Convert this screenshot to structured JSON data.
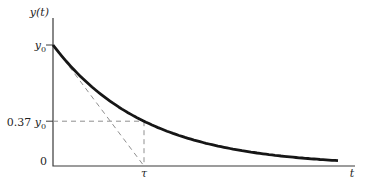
{
  "figure_labels": {
    "y_axis": "y(t)",
    "y0": {
      "base": "y",
      "sub": "0"
    },
    "decay_level": {
      "prefix": "0.37 ",
      "base": "y",
      "sub": "0"
    },
    "origin": "0",
    "tau": "τ",
    "t_axis": "t"
  },
  "colors": {
    "curve": "#161616",
    "axis": "#3a3a3a",
    "dashed_guides": "#8f8f8f",
    "text": "#1f1f1f",
    "background": "#ffffff"
  },
  "chart_data": {
    "type": "line",
    "equation": "y(t) = y0 · e^(−t/τ)",
    "xlabel": "t",
    "ylabel": "y(t)",
    "x_ticks": [
      {
        "value": 0,
        "label": "0"
      },
      {
        "value": 1,
        "label": "τ"
      }
    ],
    "y_ticks": [
      {
        "value": 1.0,
        "label": "y0"
      },
      {
        "value": 0.37,
        "label": "0.37 y0"
      }
    ],
    "decay_ratio_at_tau": 0.37,
    "x_range_in_tau": [
      0,
      3.32
    ],
    "curve_end_in_tau": 3.16,
    "y_range_over_y0": [
      0,
      1.1
    ],
    "key_points": [
      {
        "t_over_tau": 0,
        "y_over_y0": 1.0,
        "note": "initial value y0 marked by tick on y-axis"
      },
      {
        "t_over_tau": 1,
        "y_over_y0": 0.37,
        "note": "value after one time constant τ"
      }
    ],
    "annotations": [
      "dashed tangent line to the curve at t=0, intersecting the t-axis at t=τ",
      "dashed horizontal guide from 0.37·y0 on the y-axis to the curve",
      "dashed vertical guide from t=τ on the t-axis up to the curve"
    ],
    "grid": false,
    "legend": false
  }
}
